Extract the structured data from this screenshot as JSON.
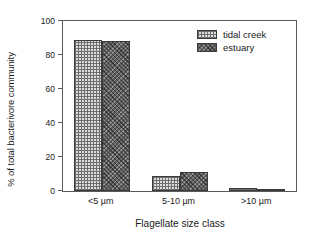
{
  "chart_data": {
    "type": "bar",
    "title": "",
    "subtitle": "",
    "xlabel": "Flagellate size class",
    "ylabel": "% of total bacterivore community",
    "categories": [
      "<5 µm",
      "5-10 µm",
      ">10 µm"
    ],
    "series": [
      {
        "name": "tidal creek",
        "values": [
          89,
          9,
          2
        ],
        "fill": "light-crosshatch",
        "color": "#dcdcdc"
      },
      {
        "name": "estuary",
        "values": [
          88,
          11,
          1
        ],
        "fill": "dark-stipple",
        "color": "#5e5e5e"
      }
    ],
    "ylim": [
      0,
      100
    ],
    "yticks": [
      0,
      20,
      40,
      60,
      80,
      100
    ],
    "ytick_labels": [
      "0",
      "20",
      "40",
      "60",
      "80",
      "100"
    ],
    "grid": false,
    "legend_position": "top-right-inside",
    "axis_color": "#5a5a5a",
    "text_color": "#1a1a1a",
    "background": "#ffffff"
  }
}
